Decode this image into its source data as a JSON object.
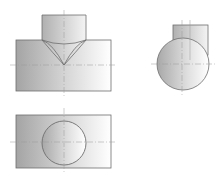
{
  "title": "Orthographic projection of two intersecting cylinders (T-joint)",
  "colors": {
    "background": "#ffffff",
    "outline": "#6e6e6e",
    "centerline": "#9a9a9a",
    "fill_dark": "#a4a4a4",
    "fill_light": "#ffffff"
  },
  "views": [
    {
      "name": "Front view",
      "description": "Horizontal cylinder with vertical cylinder on top; V-shaped intersection curve"
    },
    {
      "name": "Side view",
      "description": "Circle (horizontal cylinder end) with rectangle of vertical cylinder behind"
    },
    {
      "name": "Top view",
      "description": "Rectangle (horizontal cylinder) with circle (vertical cylinder)"
    }
  ]
}
